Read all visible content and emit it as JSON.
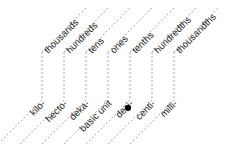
{
  "diagram": {
    "title": "",
    "place_values": [
      "thousands",
      "hundreds",
      "tens",
      "ones",
      "tenths",
      "hundredths",
      "thousandths"
    ],
    "metric_prefixes": [
      "kilo-",
      "hecto-",
      "deka-",
      "basic unit",
      "deci-",
      "centi-",
      "milli-"
    ],
    "decimal_point": "•",
    "colors": {
      "line": "#a8a8a8",
      "text": "#222222",
      "dot": "#000000"
    }
  },
  "columns": [
    {
      "x": 42,
      "top": "thousands",
      "bottom": "kilo-"
    },
    {
      "x": 64,
      "top": "hundreds",
      "bottom": "hecto-"
    },
    {
      "x": 86,
      "top": "tens",
      "bottom": "deka-"
    },
    {
      "x": 108,
      "top": "ones",
      "bottom": "basic unit"
    },
    {
      "x": 130,
      "top": "tenths",
      "bottom": "deci-"
    },
    {
      "x": 152,
      "top": "hundredths",
      "bottom": "centi-"
    },
    {
      "x": 174,
      "top": "thousandths",
      "bottom": "milli-"
    }
  ]
}
